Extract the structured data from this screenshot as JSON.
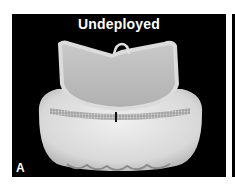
{
  "figure": {
    "panel_title": "Undeployed",
    "panel_letter": "A",
    "colors": {
      "background": "#000000",
      "label_text": "#ffffff",
      "device_light": "#e6e6e6",
      "device_mid": "#bdbdbd",
      "device_shadow": "#8a8a8a"
    }
  }
}
